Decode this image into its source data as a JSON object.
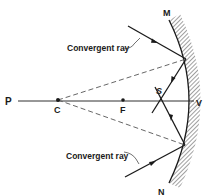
{
  "diagram": {
    "type": "convex-mirror-ray-diagram",
    "labels": {
      "P": "P",
      "C": "C",
      "F": "F",
      "V": "V",
      "S": "S",
      "M": "M",
      "N": "N"
    },
    "annotations": {
      "upper_ray": "Convergent ray",
      "lower_ray": "Convergent ray"
    },
    "colors": {
      "line": "#1a1a1a",
      "dashed": "#555555",
      "hatch": "#888888",
      "background": "#ffffff"
    }
  }
}
